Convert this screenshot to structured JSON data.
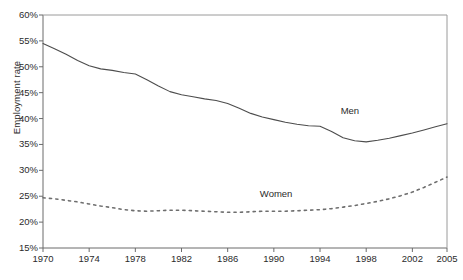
{
  "chart_data": {
    "type": "line",
    "title": "",
    "xlabel": "",
    "ylabel": "Employment rate",
    "xlim": [
      1970,
      2005
    ],
    "ylim": [
      15,
      60
    ],
    "grid": false,
    "legend_position": "inline-annotations",
    "x_ticks": [
      "1970",
      "1974",
      "1978",
      "1982",
      "1986",
      "1990",
      "1994",
      "1998",
      "2002",
      "2005"
    ],
    "x_tick_values": [
      1970,
      1974,
      1978,
      1982,
      1986,
      1990,
      1994,
      1998,
      2002,
      2005
    ],
    "y_ticks": [
      "15%",
      "20%",
      "25%",
      "30%",
      "35%",
      "40%",
      "45%",
      "50%",
      "55%",
      "60%"
    ],
    "y_tick_values": [
      15,
      20,
      25,
      30,
      35,
      40,
      45,
      50,
      55,
      60
    ],
    "x": [
      1970,
      1971,
      1972,
      1973,
      1974,
      1975,
      1976,
      1977,
      1978,
      1979,
      1980,
      1981,
      1982,
      1983,
      1984,
      1985,
      1986,
      1987,
      1988,
      1989,
      1990,
      1991,
      1992,
      1993,
      1994,
      1995,
      1996,
      1997,
      1998,
      1999,
      2000,
      2001,
      2002,
      2003,
      2004,
      2005
    ],
    "series": [
      {
        "name": "Men",
        "style": "solid",
        "color": "#4d4d4d",
        "values": [
          54.5,
          53.5,
          52.4,
          51.2,
          50.2,
          49.6,
          49.3,
          48.9,
          48.6,
          47.5,
          46.3,
          45.2,
          44.6,
          44.2,
          43.8,
          43.5,
          42.9,
          42.0,
          41.0,
          40.3,
          39.8,
          39.3,
          38.9,
          38.6,
          38.5,
          37.5,
          36.3,
          35.7,
          35.5,
          35.8,
          36.2,
          36.7,
          37.2,
          37.8,
          38.4,
          39.0
        ]
      },
      {
        "name": "Women",
        "style": "dotted",
        "color": "#6e6e6e",
        "values": [
          24.7,
          24.5,
          24.2,
          23.9,
          23.5,
          23.1,
          22.8,
          22.4,
          22.2,
          22.1,
          22.2,
          22.3,
          22.3,
          22.2,
          22.1,
          22.0,
          21.9,
          21.9,
          22.0,
          22.1,
          22.1,
          22.1,
          22.2,
          22.3,
          22.4,
          22.6,
          22.9,
          23.2,
          23.6,
          24.0,
          24.5,
          25.1,
          25.8,
          26.7,
          27.7,
          28.7
        ]
      }
    ],
    "annotations": [
      {
        "text": "Men",
        "x": 1997,
        "y": 41.5
      },
      {
        "text": "Women",
        "x": 1990,
        "y": 25.5
      }
    ]
  }
}
